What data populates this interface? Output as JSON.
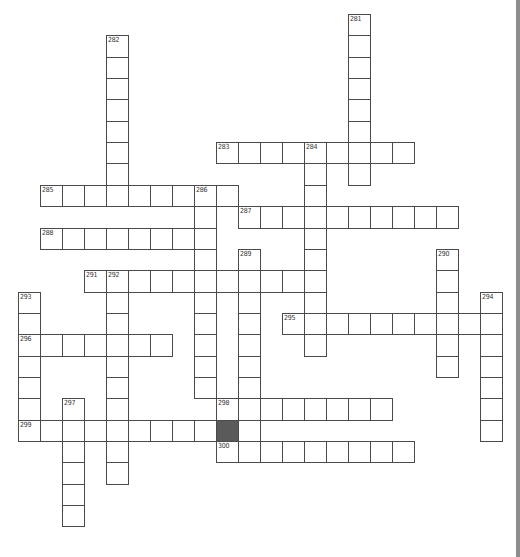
{
  "puzzle": {
    "grid": {
      "origin_x": 18,
      "origin_y": 14,
      "cell_w": 22,
      "cell_h": 21.35
    },
    "colors": {
      "border": "#4a4a4a",
      "block": "#5a5a5a",
      "background": "#ffffff",
      "edge_strip": "#8c8c8c"
    },
    "words": [
      {
        "number": "281",
        "direction": "down",
        "col": 15,
        "row": 0,
        "length": 8
      },
      {
        "number": "282",
        "direction": "down",
        "col": 4,
        "row": 1,
        "length": 8
      },
      {
        "number": "283",
        "direction": "across",
        "col": 9,
        "row": 6,
        "length": 9
      },
      {
        "number": "284",
        "direction": "down",
        "col": 13,
        "row": 6,
        "length": 10
      },
      {
        "number": "285",
        "direction": "across",
        "col": 1,
        "row": 8,
        "length": 9
      },
      {
        "number": "286",
        "direction": "down",
        "col": 8,
        "row": 8,
        "length": 10
      },
      {
        "number": "287",
        "direction": "across",
        "col": 10,
        "row": 9,
        "length": 10
      },
      {
        "number": "288",
        "direction": "across",
        "col": 1,
        "row": 10,
        "length": 8
      },
      {
        "number": "289",
        "direction": "down",
        "col": 10,
        "row": 11,
        "length": 10
      },
      {
        "number": "290",
        "direction": "down",
        "col": 19,
        "row": 11,
        "length": 6
      },
      {
        "number": "291",
        "direction": "across",
        "col": 3,
        "row": 12,
        "length": 11
      },
      {
        "number": "292",
        "direction": "down",
        "col": 4,
        "row": 12,
        "length": 10
      },
      {
        "number": "293",
        "direction": "down",
        "col": 0,
        "row": 13,
        "length": 7
      },
      {
        "number": "294",
        "direction": "down",
        "col": 21,
        "row": 13,
        "length": 7
      },
      {
        "number": "295",
        "direction": "across",
        "col": 12,
        "row": 14,
        "length": 10
      },
      {
        "number": "296",
        "direction": "across",
        "col": 0,
        "row": 15,
        "length": 7
      },
      {
        "number": "297",
        "direction": "down",
        "col": 2,
        "row": 18,
        "length": 6
      },
      {
        "number": "298",
        "direction": "across",
        "col": 9,
        "row": 18,
        "length": 8
      },
      {
        "number": "299",
        "direction": "across",
        "col": 0,
        "row": 19,
        "length": 9
      },
      {
        "number": "300",
        "direction": "across",
        "col": 9,
        "row": 20,
        "length": 9
      }
    ],
    "blocks": [
      {
        "col": 9,
        "row": 19
      }
    ]
  }
}
